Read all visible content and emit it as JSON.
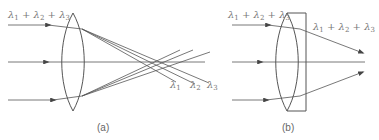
{
  "panel_a": {
    "caption": "(a)",
    "input_label": {
      "parts": [
        "λ",
        "1",
        " + ",
        "λ",
        "2",
        " + ",
        "λ",
        "3"
      ]
    },
    "focus_labels": [
      {
        "sym": "λ",
        "sub": "1"
      },
      {
        "sym": "λ",
        "sub": "2"
      },
      {
        "sym": "λ",
        "sub": "3"
      }
    ]
  },
  "panel_b": {
    "caption": "(b)",
    "input_label": {
      "parts": [
        "λ",
        "1",
        " + ",
        "λ",
        "2",
        " + ",
        "λ",
        "3"
      ]
    },
    "output_label": {
      "parts": [
        "λ",
        "1",
        " + ",
        "λ",
        "2",
        " + ",
        "λ",
        "3"
      ]
    }
  },
  "colors": {
    "line": "#555555",
    "text": "#777777"
  }
}
